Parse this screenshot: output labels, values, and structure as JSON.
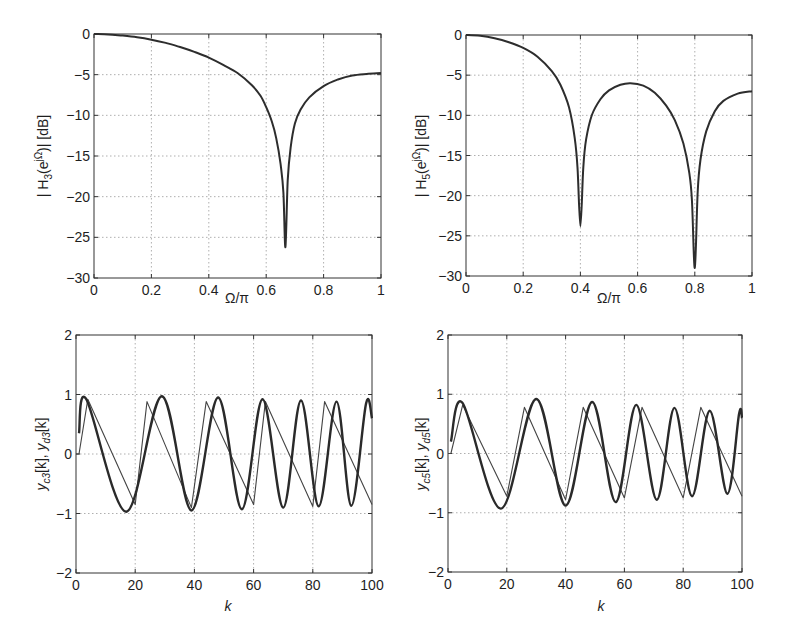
{
  "chart_data": [
    {
      "id": "H3",
      "type": "line",
      "xlabel": "Ω/π",
      "ylabel": "| H_3(e^{jΩ})| [dB]",
      "ylabel_main": "| H",
      "ylabel_sub": "3",
      "ylabel_rest": "(e",
      "ylabel_sup": "jΩ",
      "ylabel_end": ")| [dB]",
      "xlim": [
        0,
        1
      ],
      "ylim": [
        -30,
        0
      ],
      "xticks": [
        "0",
        "0.2",
        "0.4",
        "0.6",
        "0.8",
        "1"
      ],
      "yticks": [
        "0",
        "-5",
        "-10",
        "-15",
        "-20",
        "-25",
        "-30"
      ],
      "grid": true,
      "series": [
        {
          "name": "|H3| dB",
          "x": [
            0,
            0.05,
            0.1,
            0.15,
            0.2,
            0.25,
            0.3,
            0.35,
            0.4,
            0.45,
            0.5,
            0.55,
            0.58,
            0.6,
            0.62,
            0.635,
            0.65,
            0.66,
            0.667,
            0.675,
            0.685,
            0.7,
            0.72,
            0.75,
            0.8,
            0.85,
            0.9,
            0.95,
            1.0
          ],
          "y": [
            0,
            -0.05,
            -0.2,
            -0.4,
            -0.7,
            -1.1,
            -1.6,
            -2.2,
            -2.9,
            -3.8,
            -4.8,
            -6.3,
            -7.6,
            -9.0,
            -10.8,
            -12.8,
            -16.0,
            -19.5,
            -26.2,
            -18.0,
            -14.0,
            -11.0,
            -9.3,
            -7.8,
            -6.4,
            -5.6,
            -5.1,
            -4.9,
            -4.8
          ]
        }
      ]
    },
    {
      "id": "H5",
      "type": "line",
      "xlabel": "Ω/π",
      "ylabel": "| H_5(e^{jΩ})| [dB]",
      "ylabel_main": "| H",
      "ylabel_sub": "5",
      "ylabel_rest": "(e",
      "ylabel_sup": "jΩ",
      "ylabel_end": ")| [dB]",
      "xlim": [
        0,
        1
      ],
      "ylim": [
        -30,
        0
      ],
      "xticks": [
        "0",
        "0.2",
        "0.4",
        "0.6",
        "0.8",
        "1"
      ],
      "yticks": [
        "0",
        "-5",
        "-10",
        "-15",
        "-20",
        "-25",
        "-30"
      ],
      "grid": true,
      "series": [
        {
          "name": "|H5| dB",
          "x": [
            0,
            0.05,
            0.1,
            0.15,
            0.2,
            0.25,
            0.3,
            0.33,
            0.36,
            0.38,
            0.39,
            0.4,
            0.41,
            0.42,
            0.44,
            0.47,
            0.5,
            0.54,
            0.575,
            0.62,
            0.66,
            0.7,
            0.73,
            0.76,
            0.78,
            0.79,
            0.8,
            0.81,
            0.82,
            0.84,
            0.87,
            0.9,
            0.95,
            1.0
          ],
          "y": [
            0,
            -0.1,
            -0.4,
            -0.9,
            -1.6,
            -2.7,
            -4.5,
            -6.2,
            -9.0,
            -12.8,
            -16.5,
            -23.8,
            -16.5,
            -13.0,
            -10.0,
            -8.0,
            -6.9,
            -6.2,
            -6.0,
            -6.3,
            -7.2,
            -8.8,
            -10.6,
            -13.5,
            -17.0,
            -20.5,
            -29.0,
            -19.5,
            -15.5,
            -12.0,
            -9.5,
            -8.2,
            -7.3,
            -7.0
          ]
        }
      ]
    },
    {
      "id": "y3",
      "type": "line",
      "xlabel": "k",
      "ylabel": "y_c3[k],  y_d3[k]",
      "xlim": [
        0,
        100
      ],
      "ylim": [
        -2,
        2
      ],
      "xticks": [
        "0",
        "20",
        "40",
        "60",
        "80",
        "100"
      ],
      "yticks": [
        "2",
        "1",
        "0",
        "-1",
        "-2"
      ],
      "grid": true,
      "series": [
        {
          "name": "thin (sawtooth input)",
          "x": [
            0,
            1,
            4,
            20,
            24,
            39,
            44,
            60,
            64,
            80,
            84,
            100
          ],
          "y": [
            0,
            0,
            0.92,
            -0.85,
            0.88,
            -0.9,
            0.88,
            -0.85,
            0.88,
            -0.88,
            0.88,
            -0.85
          ]
        },
        {
          "name": "thick (filtered output)",
          "x": [
            1,
            3.5,
            17,
            29,
            39,
            48,
            56,
            63,
            70,
            76,
            82,
            88,
            93,
            98,
            100
          ],
          "y": [
            0.35,
            0.92,
            -0.97,
            0.97,
            -0.95,
            0.95,
            -0.93,
            0.92,
            -0.9,
            0.9,
            -0.88,
            0.88,
            -0.87,
            0.85,
            0.6
          ]
        }
      ]
    },
    {
      "id": "y5",
      "type": "line",
      "xlabel": "k",
      "ylabel": "y_c5[k],  y_d5[k]",
      "xlim": [
        0,
        100
      ],
      "ylim": [
        -2,
        2
      ],
      "xticks": [
        "0",
        "20",
        "40",
        "60",
        "80",
        "100"
      ],
      "yticks": [
        "2",
        "1",
        "0",
        "-1",
        "-2"
      ],
      "grid": true,
      "series": [
        {
          "name": "thin (sawtooth input)",
          "x": [
            0,
            1,
            5,
            20,
            26,
            40,
            46,
            60,
            66,
            80,
            86,
            100
          ],
          "y": [
            0,
            0,
            0.82,
            -0.72,
            0.78,
            -0.78,
            0.78,
            -0.75,
            0.78,
            -0.75,
            0.78,
            -0.72
          ]
        },
        {
          "name": "thick (filtered output)",
          "x": [
            1,
            5,
            18,
            30,
            40,
            49,
            57,
            64,
            71,
            77,
            83,
            89,
            95,
            99,
            100
          ],
          "y": [
            0.2,
            0.85,
            -0.93,
            0.92,
            -0.88,
            0.87,
            -0.82,
            0.82,
            -0.78,
            0.77,
            -0.72,
            0.72,
            -0.68,
            0.67,
            0.6
          ]
        }
      ]
    }
  ],
  "panels": {
    "tl": {
      "xlabel": "Ω/π",
      "ylabel_pre": "| H",
      "ylabel_sub": "3",
      "ylabel_mid": "(e",
      "ylabel_sup": "jΩ",
      "ylabel_post": ")| [dB]"
    },
    "tr": {
      "xlabel": "Ω/π",
      "ylabel_pre": "| H",
      "ylabel_sub": "5",
      "ylabel_mid": "(e",
      "ylabel_sup": "jΩ",
      "ylabel_post": ")| [dB]"
    },
    "bl": {
      "xlabel": "k",
      "y1": "y",
      "y1_sub": "c3",
      "y1_post": "[k],  ",
      "y2": "y",
      "y2_sub": "d3",
      "y2_post": "[k]"
    },
    "br": {
      "xlabel": "k",
      "y1": "y",
      "y1_sub": "c5",
      "y1_post": "[k],  ",
      "y2": "y",
      "y2_sub": "d5",
      "y2_post": "[k]"
    }
  }
}
